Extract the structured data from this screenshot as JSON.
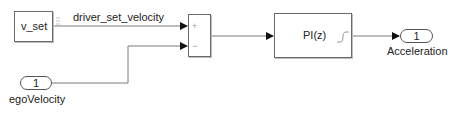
{
  "diagram": {
    "type": "simulink-block-diagram",
    "blocks": {
      "v_set": {
        "label": "v_set",
        "kind": "constant/from-workspace"
      },
      "sum": {
        "kind": "sum",
        "signs": [
          "+",
          "−"
        ]
      },
      "pi": {
        "label": "PI(z)",
        "kind": "discrete-pi-controller",
        "icon": "step-response-icon"
      },
      "ego_inport": {
        "number": "1",
        "name": "egoVelocity",
        "kind": "inport"
      },
      "accel_outport": {
        "number": "1",
        "name": "Acceleration",
        "kind": "outport"
      }
    },
    "signals": [
      {
        "from": "v_set",
        "to": "sum.+",
        "label": "driver_set_velocity"
      },
      {
        "from": "egoVelocity",
        "to": "sum.−",
        "label": ""
      },
      {
        "from": "sum",
        "to": "PI(z)",
        "label": ""
      },
      {
        "from": "PI(z)",
        "to": "Acceleration",
        "label": ""
      }
    ],
    "colors": {
      "line": "#7a7a7a",
      "block_border": "#6a6a6a",
      "arrow": "#111111",
      "background": "#ffffff"
    }
  }
}
